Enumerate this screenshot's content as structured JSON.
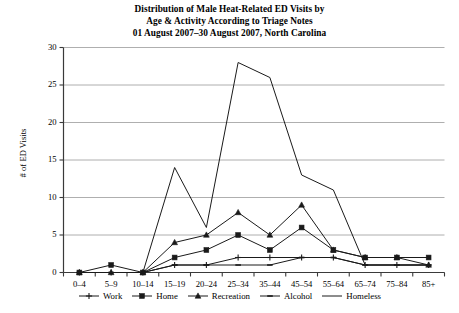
{
  "title": {
    "line1": "Distribution of Male Heat-Related ED Visits by",
    "line2": "Age & Activity According to Triage Notes",
    "line3": "01 August 2007–30 August 2007, North Carolina"
  },
  "chart_data": {
    "type": "line",
    "title": "Distribution of Male Heat-Related ED Visits by Age & Activity According to Triage Notes 01 August 2007–30 August 2007, North Carolina",
    "xlabel": "",
    "ylabel": "# of ED Visits",
    "ylim": [
      0,
      30
    ],
    "yticks": [
      0,
      5,
      10,
      15,
      20,
      25,
      30
    ],
    "ytick_labels": [
      "0",
      "5",
      "10",
      "15",
      "20",
      "25",
      "30"
    ],
    "grid": true,
    "grid_axis": "y",
    "legend_position": "bottom",
    "categories": [
      "0–4",
      "5–9",
      "10–14",
      "15–19",
      "20–24",
      "25–34",
      "35–44",
      "45–54",
      "55–64",
      "65–74",
      "75–84",
      "85+"
    ],
    "series": [
      {
        "name": "Work",
        "marker": "plus",
        "color": "#000000",
        "values": [
          0,
          0,
          0,
          1,
          1,
          2,
          2,
          2,
          2,
          1,
          1,
          1
        ]
      },
      {
        "name": "Home",
        "marker": "square",
        "color": "#000000",
        "values": [
          0,
          1,
          0,
          2,
          3,
          5,
          3,
          6,
          3,
          2,
          2,
          2
        ]
      },
      {
        "name": "Recreation",
        "marker": "triangle",
        "color": "#000000",
        "values": [
          0,
          0,
          0,
          4,
          5,
          8,
          5,
          9,
          3,
          2,
          2,
          1
        ]
      },
      {
        "name": "Alcohol",
        "marker": "dash",
        "color": "#000000",
        "values": [
          0,
          0,
          0,
          1,
          1,
          1,
          1,
          2,
          2,
          1,
          1,
          1
        ]
      },
      {
        "name": "Homeless",
        "marker": "none",
        "color": "#000000",
        "values": [
          0,
          0,
          0,
          14,
          6,
          28,
          26,
          13,
          11,
          1,
          1,
          1
        ]
      }
    ]
  },
  "legend": {
    "items": [
      {
        "label": "Work",
        "marker": "plus"
      },
      {
        "label": "Home",
        "marker": "square"
      },
      {
        "label": "Recreation",
        "marker": "triangle"
      },
      {
        "label": "Alcohol",
        "marker": "dash"
      },
      {
        "label": "Homeless",
        "marker": "none"
      }
    ]
  },
  "colors": {
    "line": "#1a1a1a",
    "grid": "#9a9a9a",
    "axis": "#3a3a3a",
    "background": "#ffffff"
  }
}
